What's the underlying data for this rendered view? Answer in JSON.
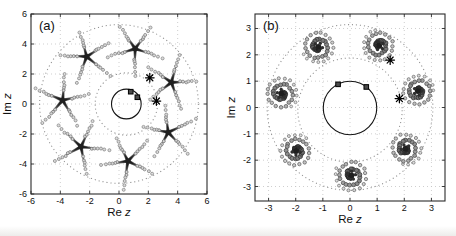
{
  "figure": {
    "width": 456,
    "height": 236,
    "background": "#ffffff",
    "colors": {
      "frame": "#2a2a2a",
      "grid": "#c3c3c3",
      "dotted_circle": "#8f8f8f",
      "solid_circle": "#141414",
      "marker_black": "#000000",
      "square_fill": "#4a4a4a",
      "arm_dark": "#1f1f1f",
      "arm_mid": "#555555",
      "dot_stroke": "#7d7d7d",
      "dot_fill": "#ededed",
      "tick_text": "#111111"
    }
  },
  "chart_data": [
    {
      "id": "a",
      "type": "scatter",
      "panel_label": "(a)",
      "xlabel": "Re z",
      "ylabel": "Im z",
      "xlim": [
        -6,
        6
      ],
      "ylim": [
        -6,
        6
      ],
      "xticks": [
        -6,
        -4,
        -2,
        0,
        2,
        4,
        6
      ],
      "yticks": [
        -6,
        -4,
        -2,
        0,
        2,
        4,
        6
      ],
      "grid": true,
      "circles": {
        "outer_dotted": {
          "cx": 0,
          "cy": 0,
          "r": 5.35
        },
        "inner_dotted": {
          "cx": 0.5,
          "cy": 0,
          "r": 2.1
        },
        "solid": {
          "cx": 0.5,
          "cy": 0,
          "r": 1.0
        }
      },
      "square_markers": [
        [
          0.8,
          0.82
        ],
        [
          1.25,
          0.45
        ]
      ],
      "asterisk_markers": [
        [
          2.1,
          1.75
        ],
        [
          2.55,
          0.2
        ]
      ],
      "clusters": {
        "glyph": "star5",
        "count": 7,
        "ring_radius": 3.85,
        "angles_deg": [
          22,
          73.4,
          124.9,
          176.3,
          227.7,
          279.1,
          330.6
        ],
        "rotations_deg": [
          2,
          53,
          33,
          13,
          65,
          45,
          25
        ],
        "arm_length": 1.05,
        "dot_trail_end": 1.8
      }
    },
    {
      "id": "b",
      "type": "scatter",
      "panel_label": "(b)",
      "xlabel": "Re z",
      "ylabel": "Im z",
      "xlim": [
        -3.5,
        3.5
      ],
      "ylim": [
        -3.55,
        3.55
      ],
      "xticks": [
        -3,
        -2,
        -1,
        0,
        1,
        2,
        3
      ],
      "yticks": [
        -3,
        -2,
        -1,
        0,
        1,
        2,
        3
      ],
      "grid": true,
      "circles": {
        "outer_dotted": {
          "cx": 0,
          "cy": 0,
          "r": 3.1
        },
        "inner_dotted": {
          "cx": 0,
          "cy": -0.1,
          "r": 1.95
        },
        "solid": {
          "cx": 0,
          "cy": -0.02,
          "r": 1.0
        }
      },
      "square_markers": [
        [
          -0.44,
          0.88
        ],
        [
          0.6,
          0.78
        ]
      ],
      "asterisk_markers": [
        [
          1.48,
          1.8
        ],
        [
          1.82,
          0.34
        ]
      ],
      "clusters": {
        "glyph": "spiral",
        "count": 7,
        "ring_radius": 2.58,
        "angles_deg": [
          14,
          65.4,
          116.9,
          168.3,
          219.7,
          271.1,
          322.6
        ],
        "rotations_deg": [
          0,
          103,
          206,
          309,
          52,
          155,
          258
        ],
        "outer_radius": 0.6,
        "turns": 2.3
      }
    }
  ]
}
